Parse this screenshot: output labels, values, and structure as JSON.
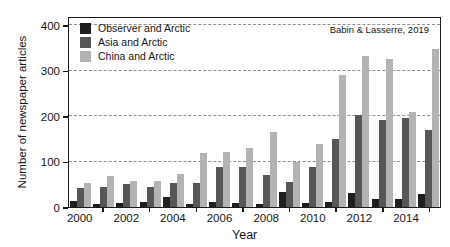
{
  "chart_data": {
    "type": "bar",
    "title": "",
    "xlabel": "Year",
    "ylabel": "Number of newspaper articles",
    "annotation": "Babin & Lasserre, 2019",
    "categories": [
      2000,
      2001,
      2002,
      2003,
      2004,
      2005,
      2006,
      2007,
      2008,
      2009,
      2010,
      2011,
      2012,
      2013,
      2014,
      2015
    ],
    "x_tick_labels": [
      "2000",
      "2002",
      "2004",
      "2006",
      "2008",
      "2010",
      "2012",
      "2014"
    ],
    "y_ticks": [
      0,
      100,
      200,
      300,
      400
    ],
    "ylim": [
      0,
      420
    ],
    "grid": "horizontal dashed lines at 100, 200, 300, 400",
    "legend_position": "top-left inside plot",
    "frame": "full box border around plot",
    "series": [
      {
        "name": "Observer and Arctic",
        "color": "#1f1f1f",
        "values": [
          14,
          7,
          9,
          12,
          22,
          7,
          12,
          10,
          7,
          33,
          9,
          11,
          30,
          18,
          18,
          28
        ]
      },
      {
        "name": "Asia and Arctic",
        "color": "#575757",
        "values": [
          42,
          45,
          50,
          44,
          53,
          52,
          88,
          88,
          70,
          54,
          89,
          150,
          203,
          192,
          195,
          170
        ]
      },
      {
        "name": "China and Arctic",
        "color": "#b3b3b3",
        "values": [
          52,
          68,
          57,
          58,
          73,
          118,
          120,
          130,
          165,
          100,
          139,
          291,
          331,
          326,
          210,
          348
        ]
      }
    ]
  }
}
